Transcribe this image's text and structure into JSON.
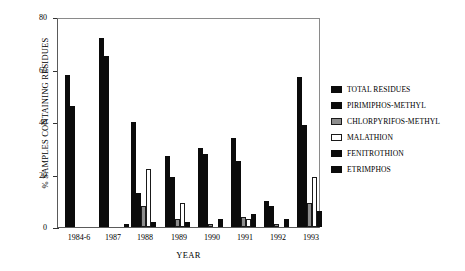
{
  "chart_data": {
    "type": "bar",
    "title": "",
    "xlabel": "YEAR",
    "ylabel": "% SAMPLES CONTAINING RESIDUES",
    "ylim": [
      0,
      80
    ],
    "yticks": [
      0,
      20,
      40,
      60,
      80
    ],
    "grid": false,
    "legend_position": "right",
    "categories": [
      "1984-6",
      "1987",
      "1988",
      "1989",
      "1990",
      "1991",
      "1992",
      "1993"
    ],
    "series": [
      {
        "name": "TOTAL RESIDUES",
        "fill": "solid-black",
        "color": "#0b0b0b",
        "values": [
          58,
          72,
          40,
          27,
          30,
          34,
          10,
          57
        ]
      },
      {
        "name": "PIRIMIPHOS-METHYL",
        "fill": "solid-black",
        "color": "#0b0b0b",
        "values": [
          46,
          65,
          13,
          19,
          28,
          25,
          8,
          39
        ]
      },
      {
        "name": "CHLORPYRIFOS-METHYL",
        "fill": "gray",
        "color": "#8d8d8d",
        "values": [
          0,
          0,
          8,
          3,
          1,
          4,
          1,
          9
        ]
      },
      {
        "name": "MALATHION",
        "fill": "white",
        "color": "#ffffff",
        "values": [
          0,
          0,
          22,
          9,
          0,
          3,
          0,
          19
        ]
      },
      {
        "name": "FENITROTHION",
        "fill": "solid-black",
        "color": "#0b0b0b",
        "values": [
          0,
          0,
          2,
          2,
          3,
          5,
          3,
          6
        ]
      },
      {
        "name": "ETRIMPHOS",
        "fill": "solid-black",
        "color": "#0b0b0b",
        "values": [
          0,
          1,
          0,
          0,
          0,
          0,
          0,
          0
        ]
      }
    ]
  }
}
